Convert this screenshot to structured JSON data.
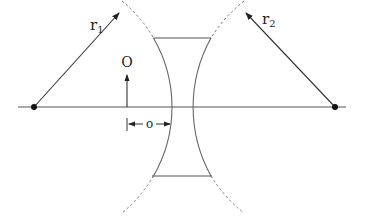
{
  "diagram": {
    "type": "thick concave lens geometry",
    "labels": {
      "r1": "r",
      "r1_sub": "1",
      "r2": "r",
      "r2_sub": "2",
      "object": "O",
      "object_distance": "o"
    },
    "colors": {
      "line": "#555555",
      "arc": "#666666",
      "point": "#111111",
      "text": "#222222"
    },
    "geometry": {
      "axis_y": 107,
      "axis_x_range": [
        18,
        346
      ],
      "center_left": [
        34,
        107
      ],
      "center_right": [
        335,
        107
      ],
      "radius_r1": 138,
      "radius_r2": 142,
      "lens_top_y": 38,
      "lens_bottom_y": 175,
      "object_x": 127,
      "object_top_y": 74
    }
  }
}
